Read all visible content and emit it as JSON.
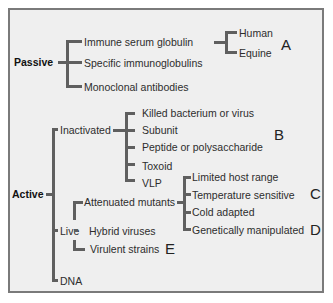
{
  "diagram": {
    "type": "vaccine-classification-tree",
    "passive": {
      "label": "Passive",
      "children": [
        {
          "label": "Immune serum globulin",
          "children": [
            "Human",
            "Equine"
          ],
          "marker": "A"
        },
        {
          "label": "Specific immunoglobulins"
        },
        {
          "label": "Monoclonal antibodies"
        }
      ]
    },
    "active": {
      "label": "Active",
      "inactivated": {
        "label": "Inactivated",
        "children": [
          "Killed bacterium or virus",
          "Subunit",
          "Peptide or polysaccharide",
          "Toxoid",
          "VLP"
        ],
        "marker": "B"
      },
      "live": {
        "label": "Live",
        "attenuated": {
          "label": "Attenuated mutants",
          "children": [
            "Limited host range",
            "Temperature sensitive",
            "Cold adapted",
            "Genetically manipulated"
          ],
          "marker_c": "C",
          "marker_d": "D"
        },
        "hybrid": "Hybrid viruses",
        "virulent": "Virulent strains",
        "marker_e": "E"
      },
      "dna": "DNA"
    }
  },
  "colors": {
    "line": "#5f5f5f",
    "background": "#efefef",
    "border": "#7a7a7a"
  }
}
